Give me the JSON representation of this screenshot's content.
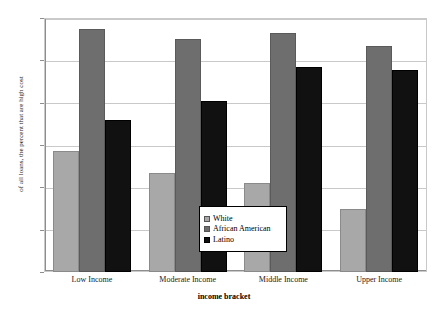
{
  "chart_data": {
    "type": "bar",
    "title": "",
    "xlabel": "income bracket",
    "ylabel": "of all loans, the percent that are high cost",
    "categories": [
      "Low Income",
      "Moderate Income",
      "Middle Income",
      "Upper Income"
    ],
    "series": [
      {
        "name": "White",
        "color": "#a8a8a8",
        "values": [
          28.5,
          23.3,
          21.0,
          15.0
        ]
      },
      {
        "name": "African American",
        "color": "#6e6e6e",
        "values": [
          57.5,
          55.0,
          56.5,
          53.3
        ]
      },
      {
        "name": "Latino",
        "color": "#111111",
        "values": [
          36.0,
          40.3,
          48.5,
          47.7
        ]
      }
    ],
    "ylim": [
      0,
      60
    ],
    "yticks": [
      0,
      10,
      20,
      30,
      40,
      50,
      60
    ],
    "ytick_labels": [
      "0",
      "10",
      "20",
      "30",
      "40",
      "50",
      "60"
    ],
    "grid": true,
    "legend_position": "inside-center"
  },
  "colors": {
    "white_series": "#a8a8a8",
    "african_american_series": "#6e6e6e",
    "latino_series": "#111111",
    "gridline": "#c9c9c9",
    "axis": "#8e8e8e"
  }
}
